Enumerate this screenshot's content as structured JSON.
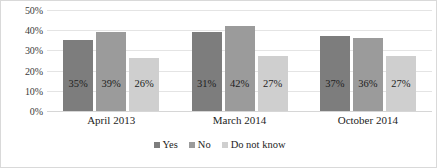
{
  "chart_data": {
    "type": "bar",
    "title": "",
    "subtitle": "",
    "xlabel": "",
    "ylabel": "",
    "categories": [
      "April 2013",
      "March 2014",
      "October 2014"
    ],
    "series": [
      {
        "name": "Yes",
        "values": [
          35,
          39,
          37
        ],
        "color": "#7d7d7d"
      },
      {
        "name": "No",
        "values": [
          39,
          42,
          36
        ],
        "color": "#9b9b9b"
      },
      {
        "name": "Do not know",
        "values": [
          26,
          27,
          27
        ],
        "color": "#cfcfcf"
      }
    ],
    "value_labels": [
      [
        "35%",
        "39%",
        "26%"
      ],
      [
        "31%",
        "42%",
        "27%"
      ],
      [
        "37%",
        "36%",
        "27%"
      ]
    ],
    "ylim": [
      0,
      50
    ],
    "y_ticks": [
      0,
      10,
      20,
      30,
      40,
      50
    ],
    "y_tick_labels": [
      "0%",
      "10%",
      "20%",
      "30%",
      "40%",
      "50%"
    ],
    "grid": true,
    "grid_orientation": "horizontal",
    "legend_position": "bottom",
    "value_label_position": "inside",
    "value_suffix": "%"
  },
  "legend": {
    "items": [
      {
        "label": "Yes",
        "color": "#7d7d7d"
      },
      {
        "label": "No",
        "color": "#9b9b9b"
      },
      {
        "label": "Do not know",
        "color": "#cfcfcf"
      }
    ]
  },
  "axis": {
    "y_labels": [
      "50%",
      "40%",
      "30%",
      "20%",
      "10%",
      "0%"
    ],
    "x_labels": [
      "April 2013",
      "March 2014",
      "October 2014"
    ]
  },
  "colors": {
    "series_yes": "#7d7d7d",
    "series_no": "#9b9b9b",
    "series_do_not_know": "#cfcfcf",
    "gridline": "#e4e4e4",
    "frame_border": "#d9d9d9",
    "text": "#1d1d1d",
    "background": "#ffffff"
  }
}
